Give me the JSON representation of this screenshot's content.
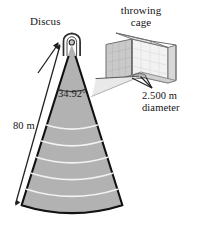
{
  "figure": {
    "title_hidden": "",
    "labels": {
      "discus": "Discus",
      "throwing_cage_line1": "throwing",
      "throwing_cage_line2": "cage",
      "angle": "34.92°",
      "distance": "80 m",
      "diameter_line1": "2.500 m",
      "diameter_line2": "diameter"
    },
    "colors": {
      "background": "#ffffff",
      "sector_fill": "#b2b2b2",
      "sector_stroke": "#111111",
      "arc_line": "#f2f2f2",
      "cage_panel_light": "#f4f4f4",
      "cage_panel_mid": "#c9c9c9",
      "cage_panel_dark": "#bdbdbd",
      "cage_stroke": "#6e6e6e",
      "leader_line": "#2a2a2a",
      "text": "#141414"
    },
    "geometry": {
      "sector_apex": {
        "x": 72,
        "y": 45
      },
      "sector_half_angle_deg": 17.46,
      "sector_total_angle_deg": 34.92,
      "sector_radius_px": 168,
      "throw_distance_m": 80,
      "circle_diameter_m": 2.5,
      "arc_count": 5
    },
    "icons": {
      "discus_arrow": "arrow-up-right-icon",
      "distance_arrow": "double-headed-arrow-icon",
      "diameter_leader": "leader-line-icon",
      "apex_cage": "cage-plan-icon",
      "thrower_circle": "throwing-circle-icon"
    }
  }
}
